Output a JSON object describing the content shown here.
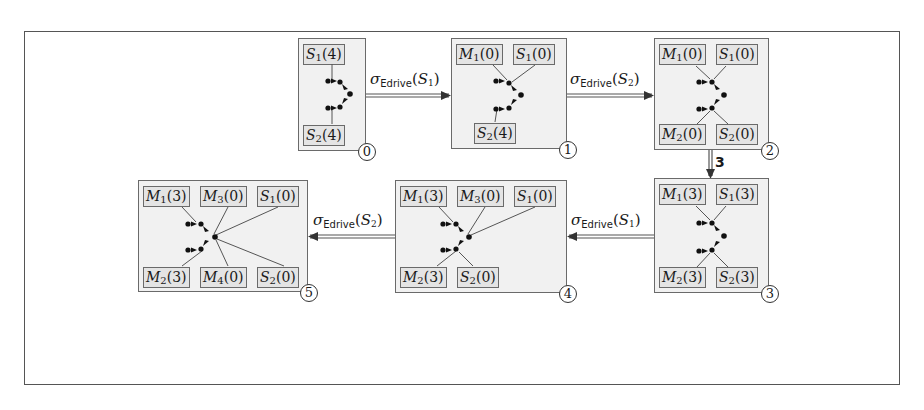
{
  "figure": {
    "frame": {
      "x": 24,
      "y": 31,
      "w": 876,
      "h": 354
    },
    "states": [
      {
        "id": "0",
        "number": "0",
        "box": {
          "x": 298,
          "y": 38,
          "w": 68,
          "h": 113
        },
        "tags": [
          {
            "sym": "S",
            "sub": "1",
            "val": "4",
            "x": 5,
            "y": 5
          },
          {
            "sym": "S",
            "sub": "2",
            "val": "4",
            "x": 5,
            "y": 86
          }
        ],
        "number_pos": {
          "x": 358,
          "y": 143
        }
      },
      {
        "id": "1",
        "number": "1",
        "box": {
          "x": 451,
          "y": 38,
          "w": 116,
          "h": 111
        },
        "tags": [
          {
            "sym": "M",
            "sub": "1",
            "val": "0",
            "x": 5,
            "y": 5
          },
          {
            "sym": "S",
            "sub": "1",
            "val": "0",
            "x": 62,
            "y": 5
          },
          {
            "sym": "S",
            "sub": "2",
            "val": "4",
            "x": 22,
            "y": 84
          }
        ],
        "number_pos": {
          "x": 559,
          "y": 141
        }
      },
      {
        "id": "2",
        "number": "2",
        "box": {
          "x": 654,
          "y": 38,
          "w": 115,
          "h": 112
        },
        "tags": [
          {
            "sym": "M",
            "sub": "1",
            "val": "0",
            "x": 5,
            "y": 5
          },
          {
            "sym": "S",
            "sub": "1",
            "val": "0",
            "x": 62,
            "y": 5
          },
          {
            "sym": "M",
            "sub": "2",
            "val": "0",
            "x": 5,
            "y": 85
          },
          {
            "sym": "S",
            "sub": "2",
            "val": "0",
            "x": 62,
            "y": 85
          }
        ],
        "number_pos": {
          "x": 761,
          "y": 142
        }
      },
      {
        "id": "3",
        "number": "3",
        "box": {
          "x": 654,
          "y": 178,
          "w": 115,
          "h": 115
        },
        "tags": [
          {
            "sym": "M",
            "sub": "1",
            "val": "3",
            "x": 5,
            "y": 5
          },
          {
            "sym": "S",
            "sub": "1",
            "val": "3",
            "x": 62,
            "y": 5
          },
          {
            "sym": "M",
            "sub": "2",
            "val": "3",
            "x": 5,
            "y": 88
          },
          {
            "sym": "S",
            "sub": "2",
            "val": "3",
            "x": 62,
            "y": 88
          }
        ],
        "number_pos": {
          "x": 761,
          "y": 285
        }
      },
      {
        "id": "4",
        "number": "4",
        "box": {
          "x": 395,
          "y": 180,
          "w": 172,
          "h": 113
        },
        "tags": [
          {
            "sym": "M",
            "sub": "1",
            "val": "3",
            "x": 5,
            "y": 5
          },
          {
            "sym": "M",
            "sub": "3",
            "val": "0",
            "x": 62,
            "y": 5
          },
          {
            "sym": "S",
            "sub": "1",
            "val": "0",
            "x": 119,
            "y": 5
          },
          {
            "sym": "M",
            "sub": "2",
            "val": "3",
            "x": 5,
            "y": 86
          },
          {
            "sym": "S",
            "sub": "2",
            "val": "0",
            "x": 62,
            "y": 86
          }
        ],
        "number_pos": {
          "x": 559,
          "y": 285
        }
      },
      {
        "id": "5",
        "number": "5",
        "box": {
          "x": 138,
          "y": 180,
          "w": 170,
          "h": 112
        },
        "tags": [
          {
            "sym": "M",
            "sub": "1",
            "val": "3",
            "x": 5,
            "y": 5
          },
          {
            "sym": "M",
            "sub": "3",
            "val": "0",
            "x": 62,
            "y": 5
          },
          {
            "sym": "S",
            "sub": "1",
            "val": "0",
            "x": 119,
            "y": 5
          },
          {
            "sym": "M",
            "sub": "2",
            "val": "3",
            "x": 5,
            "y": 86
          },
          {
            "sym": "M",
            "sub": "4",
            "val": "0",
            "x": 62,
            "y": 86
          },
          {
            "sym": "S",
            "sub": "2",
            "val": "0",
            "x": 119,
            "y": 86
          }
        ],
        "number_pos": {
          "x": 300,
          "y": 284
        }
      }
    ],
    "transitions": [
      {
        "from": "0",
        "to": "1",
        "label": {
          "sigma": "σ",
          "op": "Edrive",
          "arg": "S",
          "sub": "1"
        },
        "label_pos": {
          "x": 370,
          "y": 70
        }
      },
      {
        "from": "1",
        "to": "2",
        "label": {
          "sigma": "σ",
          "op": "Edrive",
          "arg": "S",
          "sub": "2"
        },
        "label_pos": {
          "x": 570,
          "y": 70
        }
      },
      {
        "from": "2",
        "to": "3",
        "label": {
          "text": "3"
        },
        "label_pos": {
          "x": 714,
          "y": 154
        }
      },
      {
        "from": "3",
        "to": "4",
        "label": {
          "sigma": "σ",
          "op": "Edrive",
          "arg": "S",
          "sub": "1"
        },
        "label_pos": {
          "x": 571,
          "y": 211
        }
      },
      {
        "from": "4",
        "to": "5",
        "label": {
          "sigma": "σ",
          "op": "Edrive",
          "arg": "S",
          "sub": "2"
        },
        "label_pos": {
          "x": 313,
          "y": 211
        }
      }
    ]
  }
}
